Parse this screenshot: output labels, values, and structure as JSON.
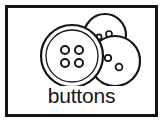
{
  "card": {
    "caption": "buttons",
    "border_color": "#151515",
    "background_color": "#ffffff",
    "ink_color": "#151515"
  },
  "illustration": {
    "name": "three-overlapping-buttons",
    "style": "black-and-white-line-art",
    "buttons": [
      {
        "id": "button-top-right",
        "label": "top-right button",
        "cx": 97,
        "cy": 27,
        "r_outer": 21,
        "r_rim": 17,
        "holes": [
          {
            "cx": 91,
            "cy": 29,
            "r": 2.6
          },
          {
            "cx": 101,
            "cy": 26,
            "r": 3.0
          }
        ]
      },
      {
        "id": "button-bottom-right",
        "label": "bottom-right button",
        "cx": 107,
        "cy": 53,
        "r_outer": 25,
        "r_rim": 21,
        "holes": [
          {
            "cx": 100,
            "cy": 50,
            "r": 3.2
          },
          {
            "cx": 111,
            "cy": 59,
            "r": 3.4
          }
        ]
      },
      {
        "id": "button-large-left",
        "label": "large left button",
        "cx": 64,
        "cy": 48,
        "r_outer": 31,
        "r_rim": 26,
        "holes": [
          {
            "cx": 57,
            "cy": 42,
            "r": 4.0
          },
          {
            "cx": 71,
            "cy": 42,
            "r": 4.0
          },
          {
            "cx": 57,
            "cy": 55,
            "r": 4.0
          },
          {
            "cx": 71,
            "cy": 55,
            "r": 4.0
          }
        ]
      }
    ]
  }
}
